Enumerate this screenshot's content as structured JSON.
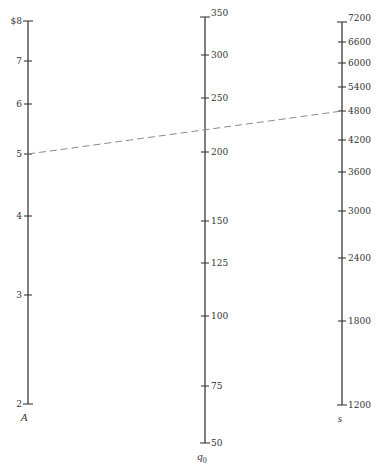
{
  "chart_data": {
    "type": "nomogram",
    "title": "",
    "axes": [
      {
        "id": "A",
        "name": "A",
        "unit_prefix": "$",
        "x": 28,
        "ticks": [
          {
            "value": 8,
            "label": "$8",
            "y": 21
          },
          {
            "value": 7,
            "label": "7",
            "y": 61
          },
          {
            "value": 6,
            "label": "6",
            "y": 104
          },
          {
            "value": 5,
            "label": "5",
            "y": 154
          },
          {
            "value": 4,
            "label": "4",
            "y": 216
          },
          {
            "value": 3,
            "label": "3",
            "y": 295
          },
          {
            "value": 2,
            "label": "2",
            "y": 404
          }
        ],
        "label_side": "left",
        "range": [
          2,
          8
        ]
      },
      {
        "id": "q0",
        "name": "q",
        "name_subscript": "0",
        "x": 205,
        "ticks": [
          {
            "value": 350,
            "label": "350",
            "y": 17
          },
          {
            "value": 300,
            "label": "300",
            "y": 55
          },
          {
            "value": 250,
            "label": "250",
            "y": 98
          },
          {
            "value": 200,
            "label": "200",
            "y": 152
          },
          {
            "value": 150,
            "label": "150",
            "y": 221
          },
          {
            "value": 125,
            "label": "125",
            "y": 263
          },
          {
            "value": 100,
            "label": "100",
            "y": 316
          },
          {
            "value": 75,
            "label": "75",
            "y": 386
          },
          {
            "value": 50,
            "label": "50",
            "y": 443
          }
        ],
        "label_side": "right",
        "range": [
          50,
          350
        ]
      },
      {
        "id": "s",
        "name": "s",
        "x": 342,
        "ticks": [
          {
            "value": 7200,
            "label": "7200",
            "y": 22
          },
          {
            "value": 6600,
            "label": "6600",
            "y": 42
          },
          {
            "value": 6000,
            "label": "6000",
            "y": 63
          },
          {
            "value": 5400,
            "label": "5400",
            "y": 87
          },
          {
            "value": 4800,
            "label": "4800",
            "y": 111
          },
          {
            "value": 4200,
            "label": "4200",
            "y": 140
          },
          {
            "value": 3600,
            "label": "3600",
            "y": 172
          },
          {
            "value": 3000,
            "label": "3000",
            "y": 211
          },
          {
            "value": 2400,
            "label": "2400",
            "y": 258
          },
          {
            "value": 1800,
            "label": "1800",
            "y": 321
          },
          {
            "value": 1200,
            "label": "1200",
            "y": 405
          }
        ],
        "label_side": "right",
        "range": [
          1200,
          7200
        ]
      }
    ],
    "example_isopleth": {
      "style": "dashed",
      "A": 5,
      "s": 4800,
      "q0_reading": 219,
      "from": {
        "x": 28,
        "y": 154
      },
      "to": {
        "x": 342,
        "y": 111
      }
    }
  }
}
